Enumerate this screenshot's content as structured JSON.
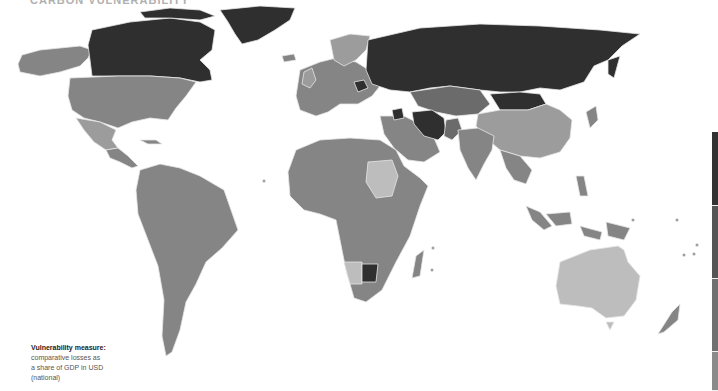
{
  "title": "CARBON VULNERABILITY",
  "caption": {
    "heading": "Vulnerability measure:",
    "line1": "comparative losses as",
    "line2": "a share of GDP in USD",
    "line3": "(national)"
  },
  "colors": {
    "darkest": "#2f2f2f",
    "dark": "#4a4a4a",
    "medium_dark": "#6b6b6b",
    "medium": "#858585",
    "light": "#9c9c9c",
    "lightest": "#bdbdbd",
    "border": "#e6e6e6",
    "background": "#ffffff"
  },
  "legend": {
    "segments": [
      {
        "color": "#333333",
        "height": 74
      },
      {
        "color": "#555555",
        "height": 73
      },
      {
        "color": "#707070",
        "height": 73
      },
      {
        "color": "#8a8a8a",
        "height": 39
      }
    ]
  },
  "regions": [
    {
      "name": "Canada",
      "shade": "darkest"
    },
    {
      "name": "Greenland",
      "shade": "darkest"
    },
    {
      "name": "Alaska",
      "shade": "medium"
    },
    {
      "name": "United States",
      "shade": "medium"
    },
    {
      "name": "Mexico",
      "shade": "light"
    },
    {
      "name": "Central America",
      "shade": "medium"
    },
    {
      "name": "South America",
      "shade": "medium"
    },
    {
      "name": "Russia",
      "shade": "darkest"
    },
    {
      "name": "Mongolia",
      "shade": "darkest"
    },
    {
      "name": "Kazakhstan / Central Asia",
      "shade": "medium_dark"
    },
    {
      "name": "Iran",
      "shade": "darkest"
    },
    {
      "name": "Syria",
      "shade": "darkest"
    },
    {
      "name": "Pakistan",
      "shade": "medium_dark"
    },
    {
      "name": "China",
      "shade": "light"
    },
    {
      "name": "India",
      "shade": "medium"
    },
    {
      "name": "Southeast Asia",
      "shade": "medium"
    },
    {
      "name": "Europe",
      "shade": "medium"
    },
    {
      "name": "Scandinavia",
      "shade": "light"
    },
    {
      "name": "Africa",
      "shade": "medium"
    },
    {
      "name": "Sudan",
      "shade": "lightest"
    },
    {
      "name": "Namibia",
      "shade": "lightest"
    },
    {
      "name": "Botswana",
      "shade": "darkest"
    },
    {
      "name": "South Africa",
      "shade": "medium"
    },
    {
      "name": "Madagascar",
      "shade": "medium"
    },
    {
      "name": "Middle East / Arabia",
      "shade": "medium"
    },
    {
      "name": "Australia",
      "shade": "lightest"
    },
    {
      "name": "New Zealand",
      "shade": "medium"
    },
    {
      "name": "Indonesia / Papua",
      "shade": "medium"
    }
  ]
}
